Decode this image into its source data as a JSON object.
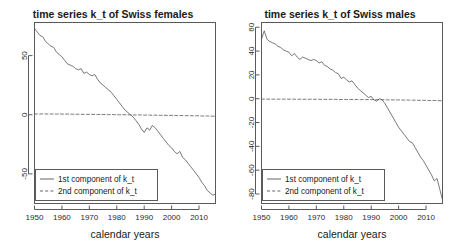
{
  "figure": {
    "background": "#ffffff",
    "line_color": "#555555",
    "axis_color": "#5a5a5a",
    "text_color": "#1a1a1a",
    "panel_count": 2
  },
  "chart_data": [
    {
      "id": "swiss-females",
      "type": "line",
      "title": "time series k_t of Swiss females",
      "xlabel": "calendar years",
      "ylabel": "",
      "xlim": [
        1950,
        2016
      ],
      "ylim": [
        -75,
        78
      ],
      "xticks": [
        1950,
        1960,
        1970,
        1980,
        1990,
        2000,
        2010
      ],
      "xtick_labels": [
        "1950",
        "1960",
        "1970",
        "1980",
        "1990",
        "2000",
        "2010"
      ],
      "yticks": [
        50,
        0,
        -50
      ],
      "ytick_labels": [
        "50",
        "0",
        "-50"
      ],
      "grid": false,
      "legend_position": "bottom-left",
      "legend": [
        "1st component of k_t",
        "2nd component of k_t"
      ],
      "x": [
        1950,
        1951,
        1952,
        1953,
        1954,
        1955,
        1956,
        1957,
        1958,
        1959,
        1960,
        1961,
        1962,
        1963,
        1964,
        1965,
        1966,
        1967,
        1968,
        1969,
        1970,
        1971,
        1972,
        1973,
        1974,
        1975,
        1976,
        1977,
        1978,
        1979,
        1980,
        1981,
        1982,
        1983,
        1984,
        1985,
        1986,
        1987,
        1988,
        1989,
        1990,
        1991,
        1992,
        1993,
        1994,
        1995,
        1996,
        1997,
        1998,
        1999,
        2000,
        2001,
        2002,
        2003,
        2004,
        2005,
        2006,
        2007,
        2008,
        2009,
        2010,
        2011,
        2012,
        2013,
        2014,
        2015,
        2016
      ],
      "series": [
        {
          "name": "1st component of k_t",
          "style": "solid",
          "values": [
            73,
            70,
            67,
            66,
            62,
            60,
            58,
            57,
            53,
            51,
            49,
            46,
            43,
            42,
            41,
            39,
            38,
            39,
            35,
            36,
            34,
            33,
            34,
            30,
            27,
            25,
            23,
            21,
            19,
            16,
            13,
            10,
            7,
            4,
            2,
            0,
            -2,
            -5,
            -8,
            -12,
            -15,
            -11,
            -13,
            -9,
            -11,
            -14,
            -17,
            -20,
            -23,
            -26,
            -28,
            -31,
            -33,
            -31,
            -36,
            -38,
            -41,
            -44,
            -47,
            -50,
            -53,
            -57,
            -60,
            -64,
            -66,
            -68,
            -67
          ]
        },
        {
          "name": "2nd component of k_t",
          "style": "dashed",
          "values": [
            0.6,
            0.7,
            0.6,
            0.8,
            0.7,
            0.6,
            0.7,
            0.6,
            0.6,
            0.7,
            0.6,
            0.5,
            0.6,
            0.5,
            0.5,
            0.4,
            0.5,
            0.4,
            0.4,
            0.3,
            0.4,
            0.3,
            0.3,
            0.2,
            0.3,
            0.2,
            0.2,
            0.1,
            0.2,
            0.1,
            0.1,
            0.0,
            0.1,
            0.0,
            -0.1,
            0.0,
            -0.1,
            -0.2,
            -0.1,
            -0.2,
            -0.3,
            -0.2,
            -0.3,
            -0.4,
            -0.3,
            -0.4,
            -0.5,
            -0.4,
            -0.5,
            -0.6,
            -0.5,
            -0.6,
            -0.7,
            -0.6,
            -0.7,
            -0.8,
            -0.7,
            -0.8,
            -0.9,
            -0.8,
            -0.9,
            -1.0,
            -1.1,
            -1.0,
            -1.1,
            -1.2,
            -1.3
          ]
        }
      ]
    },
    {
      "id": "swiss-males",
      "type": "line",
      "title": "time series k_t of Swiss males",
      "xlabel": "calendar years",
      "ylabel": "",
      "xlim": [
        1950,
        2016
      ],
      "ylim": [
        -88,
        64
      ],
      "xticks": [
        1950,
        1960,
        1970,
        1980,
        1990,
        2000,
        2010
      ],
      "xtick_labels": [
        "1950",
        "1960",
        "1970",
        "1980",
        "1990",
        "2000",
        "2010"
      ],
      "yticks": [
        60,
        40,
        20,
        0,
        -20,
        -40,
        -60,
        -80
      ],
      "ytick_labels": [
        "60",
        "40",
        "20",
        "0",
        "-20",
        "-40",
        "-60",
        "-80"
      ],
      "grid": false,
      "legend_position": "bottom-left",
      "legend": [
        "1st component of k_t",
        "2nd component of k_t"
      ],
      "x": [
        1950,
        1951,
        1952,
        1953,
        1954,
        1955,
        1956,
        1957,
        1958,
        1959,
        1960,
        1961,
        1962,
        1963,
        1964,
        1965,
        1966,
        1967,
        1968,
        1969,
        1970,
        1971,
        1972,
        1973,
        1974,
        1975,
        1976,
        1977,
        1978,
        1979,
        1980,
        1981,
        1982,
        1983,
        1984,
        1985,
        1986,
        1987,
        1988,
        1989,
        1990,
        1991,
        1992,
        1993,
        1994,
        1995,
        1996,
        1997,
        1998,
        1999,
        2000,
        2001,
        2002,
        2003,
        2004,
        2005,
        2006,
        2007,
        2008,
        2009,
        2010,
        2011,
        2012,
        2013,
        2014,
        2015,
        2016
      ],
      "series": [
        {
          "name": "1st component of k_t",
          "style": "solid",
          "values": [
            50,
            57,
            50,
            48,
            47,
            46,
            44,
            43,
            41,
            40,
            39,
            36,
            38,
            35,
            33,
            35,
            34,
            33,
            32,
            33,
            32,
            30,
            31,
            28,
            27,
            25,
            24,
            22,
            21,
            17,
            18,
            16,
            14,
            15,
            12,
            9,
            7,
            5,
            3,
            1,
            2,
            -1,
            -2,
            0,
            -1,
            -4,
            -8,
            -12,
            -16,
            -20,
            -24,
            -27,
            -30,
            -33,
            -36,
            -37,
            -41,
            -45,
            -49,
            -52,
            -56,
            -60,
            -64,
            -69,
            -67,
            -76,
            -85
          ]
        },
        {
          "name": "2nd component of k_t",
          "style": "dashed",
          "values": [
            -0.4,
            -0.3,
            -0.4,
            -0.3,
            -0.4,
            -0.3,
            -0.4,
            -0.3,
            -0.4,
            -0.3,
            -0.4,
            -0.3,
            -0.4,
            -0.5,
            -0.4,
            -0.5,
            -0.4,
            -0.5,
            -0.4,
            -0.5,
            -0.4,
            -0.5,
            -0.6,
            -0.5,
            -0.6,
            -0.5,
            -0.6,
            -0.5,
            -0.6,
            -0.7,
            -0.6,
            -0.7,
            -0.6,
            -0.7,
            -0.6,
            -0.7,
            -0.8,
            -0.7,
            -0.8,
            -0.7,
            -0.8,
            -0.7,
            -0.8,
            -0.9,
            -0.8,
            -0.9,
            -1.0,
            -0.9,
            -1.0,
            -1.1,
            -1.0,
            -1.1,
            -1.2,
            -1.1,
            -1.2,
            -1.3,
            -1.2,
            -1.3,
            -1.4,
            -1.3,
            -1.4,
            -1.5,
            -1.6,
            -1.5,
            -1.6,
            -1.7,
            -1.8
          ]
        }
      ]
    }
  ]
}
